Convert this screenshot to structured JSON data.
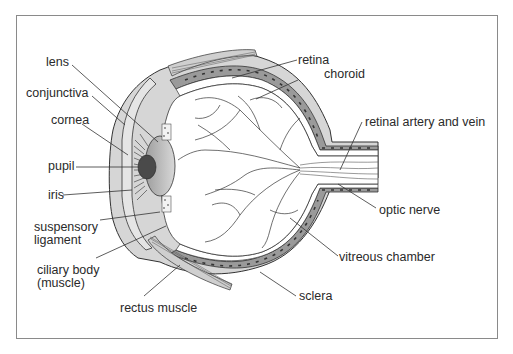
{
  "diagram": {
    "labels": {
      "lens": "lens",
      "conjunctiva": "conjunctiva",
      "cornea": "cornea",
      "pupil": "pupil",
      "iris": "iris",
      "suspensory_ligament_1": "suspensory",
      "suspensory_ligament_2": "ligament",
      "ciliary_body_1": "ciliary body",
      "ciliary_body_2": "(muscle)",
      "rectus_muscle": "rectus muscle",
      "retina": "retina",
      "choroid": "choroid",
      "retinal_artery_vein": "retinal artery and vein",
      "optic_nerve": "optic nerve",
      "vitreous_chamber": "vitreous chamber",
      "sclera": "sclera"
    },
    "colors": {
      "outline": "#333333",
      "sclera_fill": "#d6d6d6",
      "choroid_fill": "#9a9a9a",
      "pupil_fill": "#4a4a4a",
      "lens_fill": "#bdbdbd",
      "background": "#ffffff",
      "frame": "#8a8a8a"
    }
  }
}
